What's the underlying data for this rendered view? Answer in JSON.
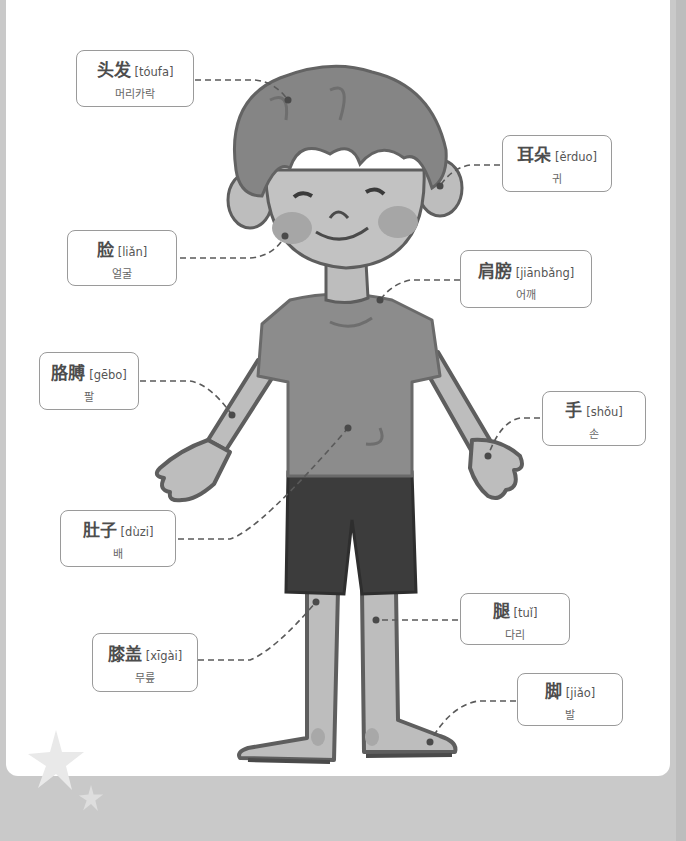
{
  "diagram": {
    "colors": {
      "background": "#c9c9c9",
      "page": "#ffffff",
      "hair": "#858585",
      "skin": "#bdbdbd",
      "shirt": "#8c8c8c",
      "shorts": "#3c3c3c",
      "outline": "#5e5e5e",
      "leader_line": "#5a5a5a",
      "label_border": "#9a9a9a"
    },
    "labels": [
      {
        "id": "hair",
        "hanzi": "头发",
        "pinyin": "[tóufa]",
        "korean": "머리카락"
      },
      {
        "id": "ear",
        "hanzi": "耳朵",
        "pinyin": "[ěrduo]",
        "korean": "귀"
      },
      {
        "id": "face",
        "hanzi": "脸",
        "pinyin": "[liǎn]",
        "korean": "얼굴"
      },
      {
        "id": "shoulder",
        "hanzi": "肩膀",
        "pinyin": "[jiānbǎng]",
        "korean": "어깨"
      },
      {
        "id": "arm",
        "hanzi": "胳膊",
        "pinyin": "[gēbo]",
        "korean": "팔"
      },
      {
        "id": "hand",
        "hanzi": "手",
        "pinyin": "[shǒu]",
        "korean": "손"
      },
      {
        "id": "belly",
        "hanzi": "肚子",
        "pinyin": "[dùzi]",
        "korean": "배"
      },
      {
        "id": "leg",
        "hanzi": "腿",
        "pinyin": "[tuǐ]",
        "korean": "다리"
      },
      {
        "id": "knee",
        "hanzi": "膝盖",
        "pinyin": "[xīgài]",
        "korean": "무릎"
      },
      {
        "id": "foot",
        "hanzi": "脚",
        "pinyin": "[jiǎo]",
        "korean": "발"
      }
    ]
  }
}
